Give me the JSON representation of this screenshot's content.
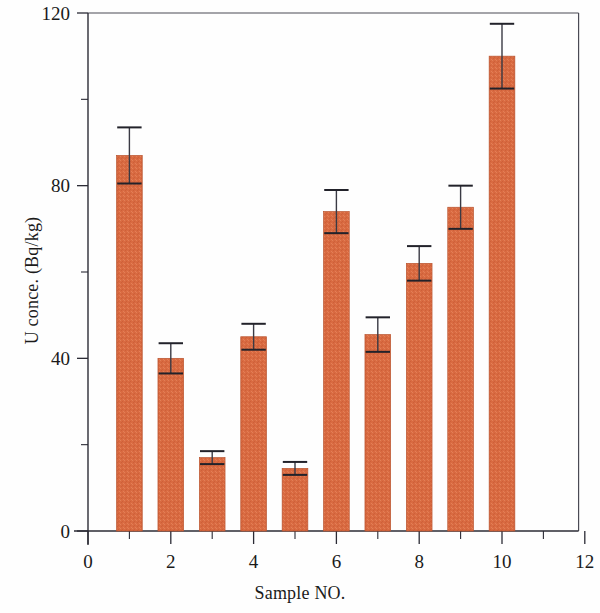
{
  "figure": {
    "background_color": "#ffffff",
    "bar_color": "#d96a41",
    "bar_edge_color": "#b9542f",
    "error_bar_color": "#3a3a44",
    "axis_color": "#2b2b35"
  },
  "chart_data": {
    "type": "bar",
    "title": "",
    "subtitle": "",
    "xlabel": "Sample NO.",
    "ylabel": "U conce. (Bq/kg)",
    "xlim": [
      0,
      12
    ],
    "ylim": [
      0,
      120
    ],
    "xticks": [
      0,
      2,
      4,
      6,
      8,
      10,
      12
    ],
    "xtick_labels": [
      "0",
      "2",
      "4",
      "6",
      "8",
      "10",
      "12"
    ],
    "xminor_ticks": [
      1,
      3,
      5,
      7,
      9,
      11
    ],
    "yticks": [
      0,
      40,
      80,
      120
    ],
    "ytick_labels": [
      "0",
      "40",
      "80",
      "120"
    ],
    "yminor_ticks": [
      20,
      60,
      100
    ],
    "grid": false,
    "legend": null,
    "categories": [
      1,
      2,
      3,
      4,
      5,
      6,
      7,
      8,
      9,
      10
    ],
    "values": [
      87,
      40,
      17,
      45,
      14.5,
      74,
      45.5,
      62,
      75,
      110
    ],
    "errors": [
      6.5,
      3.5,
      1.5,
      3,
      1.5,
      5,
      4,
      4,
      5,
      7.5
    ],
    "bar_width": 0.62,
    "annotations": []
  }
}
